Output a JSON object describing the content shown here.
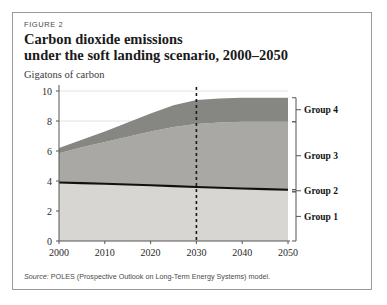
{
  "figure": {
    "label": "FIGURE 2",
    "title_line1": "Carbon dioxide emissions",
    "title_line2": "under the soft landing scenario, 2000–2050",
    "unit_label": "Gigatons of carbon",
    "source_prefix": "Source:",
    "source_text": " POLES (Prospective Outlook on Long-Term Energy Systems) model."
  },
  "colors": {
    "band_group1": "#d7d6d2",
    "band_group3": "#a9a8a4",
    "band_group4": "#868683",
    "group2_line": "#111111",
    "marker_line": "#1a1a1a",
    "border": "#9a9a9a",
    "axis": "#555555",
    "grid": "#e2e2e0",
    "bracket": "#555555"
  },
  "chart_data": {
    "type": "area",
    "title": "Carbon dioxide emissions under the soft landing scenario, 2000–2050",
    "xlabel": "",
    "ylabel": "Gigatons of carbon",
    "xlim": [
      2000,
      2050
    ],
    "ylim": [
      0,
      10
    ],
    "xticks": [
      2000,
      2010,
      2020,
      2030,
      2040,
      2050
    ],
    "yticks": [
      0,
      2,
      4,
      6,
      8,
      10
    ],
    "grid": true,
    "grid_values": [
      8,
      10
    ],
    "legend_position": "right-brackets",
    "x": [
      2000,
      2005,
      2010,
      2015,
      2020,
      2025,
      2030,
      2035,
      2040,
      2045,
      2050
    ],
    "series": [
      {
        "name": "Group 1",
        "kind": "area-cumulative-top",
        "values": [
          3.9,
          3.86,
          3.82,
          3.77,
          3.72,
          3.66,
          3.6,
          3.55,
          3.5,
          3.46,
          3.42
        ]
      },
      {
        "name": "Group 2",
        "kind": "line",
        "note": "thick black boundary line on top of Group 1",
        "values": [
          3.9,
          3.86,
          3.82,
          3.77,
          3.72,
          3.66,
          3.6,
          3.55,
          3.5,
          3.46,
          3.42
        ]
      },
      {
        "name": "Group 3",
        "kind": "area-cumulative-top",
        "values": [
          5.85,
          6.25,
          6.6,
          6.95,
          7.3,
          7.6,
          7.8,
          7.9,
          7.95,
          7.95,
          7.95
        ]
      },
      {
        "name": "Group 4",
        "kind": "area-cumulative-top",
        "values": [
          6.2,
          6.75,
          7.3,
          7.9,
          8.5,
          9.05,
          9.4,
          9.5,
          9.55,
          9.55,
          9.55
        ]
      }
    ],
    "annotations": [
      {
        "type": "vline",
        "x": 2030,
        "style": "dashed",
        "label": ""
      }
    ],
    "group_labels": [
      {
        "name": "Group 4",
        "band_top": 9.55,
        "band_bottom": 7.95
      },
      {
        "name": "Group 3",
        "band_top": 7.95,
        "band_bottom": 3.42
      },
      {
        "name": "Group 2",
        "band_top": 3.42,
        "band_bottom": 3.28
      },
      {
        "name": "Group 1",
        "band_top": 3.28,
        "band_bottom": 0.0
      }
    ]
  }
}
